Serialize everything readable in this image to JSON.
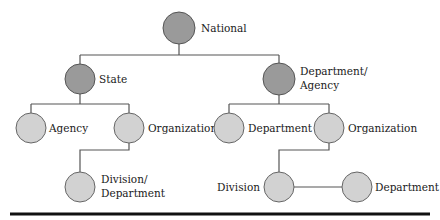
{
  "diagram": {
    "title": "",
    "nodes": [
      {
        "id": "national",
        "label": "National",
        "level": 0,
        "shade": "dark"
      },
      {
        "id": "state",
        "label": "State",
        "level": 1,
        "shade": "dark"
      },
      {
        "id": "dept_agency",
        "label_line1": "Department/",
        "label_line2": "Agency",
        "level": 1,
        "shade": "dark"
      },
      {
        "id": "state_agency",
        "label": "Agency",
        "level": 2,
        "shade": "light"
      },
      {
        "id": "state_org",
        "label": "Organization",
        "level": 2,
        "shade": "light"
      },
      {
        "id": "da_department",
        "label": "Department",
        "level": 2,
        "shade": "light"
      },
      {
        "id": "da_org",
        "label": "Organization",
        "level": 2,
        "shade": "light"
      },
      {
        "id": "state_div_dept",
        "label_line1": "Division/",
        "label_line2": "Department",
        "level": 3,
        "shade": "light"
      },
      {
        "id": "da_division",
        "label": "Division",
        "level": 3,
        "shade": "light"
      },
      {
        "id": "da_div_department",
        "label": "Department",
        "level": 3,
        "shade": "light"
      }
    ],
    "edges": [
      [
        "national",
        "state"
      ],
      [
        "national",
        "dept_agency"
      ],
      [
        "state",
        "state_agency"
      ],
      [
        "state",
        "state_org"
      ],
      [
        "dept_agency",
        "da_department"
      ],
      [
        "dept_agency",
        "da_org"
      ],
      [
        "state_org",
        "state_div_dept"
      ],
      [
        "da_org",
        "da_division"
      ],
      [
        "da_division",
        "da_div_department"
      ]
    ],
    "colors": {
      "upper_node_fill": "#9a9a9a",
      "lower_node_fill": "#d2d2d2",
      "line": "#555555",
      "rule": "#111111"
    }
  }
}
